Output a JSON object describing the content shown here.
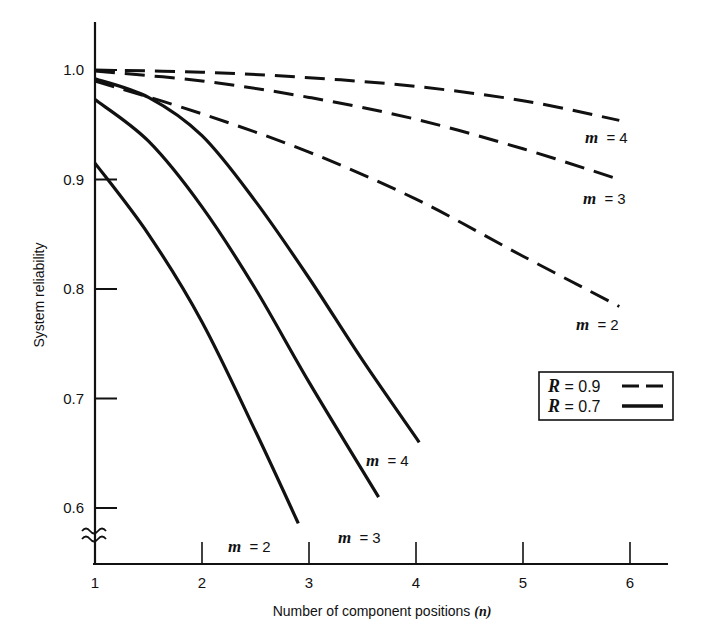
{
  "chart_data": {
    "type": "line",
    "title": "",
    "xlabel": "Number of component positions (n)",
    "xlabel_text": "Number of component positions ",
    "xlabel_var": "(n)",
    "ylabel": "System reliability",
    "xlim": [
      1,
      6.4
    ],
    "ylim": [
      0.55,
      1.05
    ],
    "y_axis_break": true,
    "grid": false,
    "x_ticks": [
      1,
      2,
      3,
      4,
      5,
      6
    ],
    "x_tick_labels": [
      "1",
      "2",
      "3",
      "4",
      "5",
      "6"
    ],
    "y_ticks": [
      0.6,
      0.7,
      0.8,
      0.9,
      1.0
    ],
    "y_tick_labels": [
      "0.6",
      "0.7",
      "0.8",
      "0.9",
      "1.0"
    ],
    "legend": {
      "position": "right-middle, boxed",
      "entries": [
        {
          "label_var": "R",
          "label_eq": " = ",
          "label_val": "0.9",
          "style": "dashed"
        },
        {
          "label_var": "R",
          "label_eq": " = ",
          "label_val": "0.7",
          "style": "solid"
        }
      ]
    },
    "series": [
      {
        "name": "R = 0.9, m = 4",
        "R": 0.9,
        "m": 4,
        "style": "dashed",
        "label": "m = 4",
        "x": [
          1,
          2,
          3,
          4,
          5,
          5.9
        ],
        "y": [
          0.9999,
          0.998,
          0.993,
          0.985,
          0.972,
          0.954
        ]
      },
      {
        "name": "R = 0.9, m = 3",
        "R": 0.9,
        "m": 3,
        "style": "dashed",
        "label": "m = 3",
        "x": [
          1,
          2,
          3,
          4,
          5,
          5.9
        ],
        "y": [
          0.999,
          0.99,
          0.975,
          0.955,
          0.928,
          0.9
        ]
      },
      {
        "name": "R = 0.9, m = 2",
        "R": 0.9,
        "m": 2,
        "style": "dashed",
        "label": "m = 2",
        "x": [
          1,
          2,
          3,
          4,
          5,
          5.9
        ],
        "y": [
          0.99,
          0.96,
          0.925,
          0.882,
          0.83,
          0.784
        ]
      },
      {
        "name": "R = 0.7, m = 4",
        "R": 0.7,
        "m": 4,
        "style": "solid",
        "label": "m = 4",
        "x": [
          1,
          1.5,
          2,
          2.5,
          3,
          3.5,
          4.03
        ],
        "y": [
          0.992,
          0.975,
          0.94,
          0.88,
          0.81,
          0.735,
          0.66
        ]
      },
      {
        "name": "R = 0.7, m = 3",
        "R": 0.7,
        "m": 3,
        "style": "solid",
        "label": "m = 3",
        "x": [
          1,
          1.5,
          2,
          2.5,
          3,
          3.65
        ],
        "y": [
          0.973,
          0.935,
          0.875,
          0.8,
          0.715,
          0.61
        ]
      },
      {
        "name": "R = 0.7, m = 2",
        "R": 0.7,
        "m": 2,
        "style": "solid",
        "label": "m = 2",
        "x": [
          1,
          1.5,
          2,
          2.5,
          2.9
        ],
        "y": [
          0.915,
          0.85,
          0.77,
          0.67,
          0.586
        ]
      }
    ],
    "curve_labels": [
      {
        "series": 0,
        "var": "m",
        "text": " = 4"
      },
      {
        "series": 1,
        "var": "m",
        "text": " = 3"
      },
      {
        "series": 2,
        "var": "m",
        "text": " = 2"
      },
      {
        "series": 3,
        "var": "m",
        "text": " = 4"
      },
      {
        "series": 4,
        "var": "m",
        "text": " = 3"
      },
      {
        "series": 5,
        "var": "m",
        "text": " = 2"
      }
    ]
  }
}
